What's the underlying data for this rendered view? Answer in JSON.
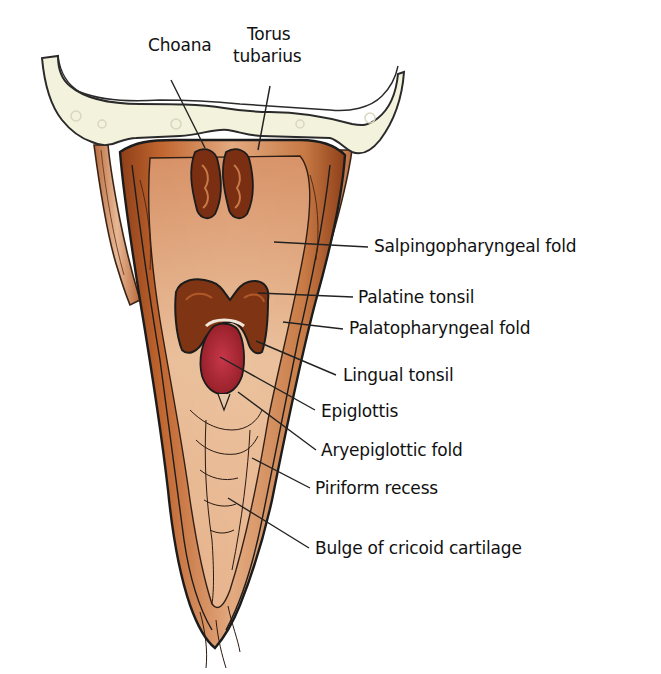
{
  "diagram": {
    "colors": {
      "bone": "#f3f2dc",
      "bone_outline": "#2a2a2a",
      "mucosa_dark": "#9a4a1e",
      "mucosa_mid": "#c06a34",
      "mucosa_light": "#e0a57a",
      "mucosa_pale": "#efcfb0",
      "tonsil": "#7a2e12",
      "epiglottis": "#b8283a",
      "outline": "#1c1c1c",
      "leader": "#222222",
      "text": "#111111"
    },
    "labels": [
      {
        "id": "choana",
        "text": "Choana",
        "x": 148,
        "y": 45,
        "line": [
          [
            171,
            80
          ],
          [
            205,
            148
          ]
        ]
      },
      {
        "id": "torus-tubarius-1",
        "text": "Torus",
        "x": 247,
        "y": 34,
        "line": null
      },
      {
        "id": "torus-tubarius-2",
        "text": "tubarius",
        "x": 233,
        "y": 56,
        "line": [
          [
            270,
            86
          ],
          [
            258,
            150
          ]
        ]
      },
      {
        "id": "salpingopharyngeal-fold",
        "text": "Salpingopharyngeal fold",
        "x": 374,
        "y": 236,
        "line": [
          [
            274,
            242
          ],
          [
            368,
            247
          ]
        ]
      },
      {
        "id": "palatine-tonsil",
        "text": "Palatine tonsil",
        "x": 358,
        "y": 287,
        "line": [
          [
            258,
            293
          ],
          [
            353,
            297
          ]
        ]
      },
      {
        "id": "palatopharyngeal-fold",
        "text": "Palatopharyngeal fold",
        "x": 349,
        "y": 318,
        "line": [
          [
            283,
            322
          ],
          [
            343,
            329
          ]
        ]
      },
      {
        "id": "lingual-tonsil",
        "text": "Lingual tonsil",
        "x": 343,
        "y": 369,
        "line": [
          [
            256,
            341
          ],
          [
            336,
            375
          ]
        ]
      },
      {
        "id": "epiglottis",
        "text": "Epiglottis",
        "x": 321,
        "y": 405,
        "line": [
          [
            220,
            357
          ],
          [
            315,
            410
          ]
        ]
      },
      {
        "id": "aryepiglottic-fold",
        "text": "Aryepiglottic fold",
        "x": 321,
        "y": 443,
        "line": [
          [
            238,
            392
          ],
          [
            316,
            450
          ]
        ]
      },
      {
        "id": "piriform-recess",
        "text": "Piriform recess",
        "x": 315,
        "y": 481,
        "line": [
          [
            252,
            458
          ],
          [
            310,
            488
          ]
        ]
      },
      {
        "id": "bulge-of-cricoid-cartilage",
        "text": "Bulge of cricoid cartilage",
        "x": 315,
        "y": 541,
        "line": [
          [
            228,
            498
          ],
          [
            309,
            548
          ]
        ]
      }
    ]
  }
}
